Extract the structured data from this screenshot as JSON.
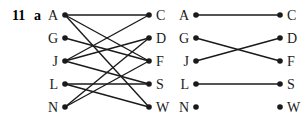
{
  "question": {
    "number": "11",
    "part": "a"
  },
  "graphs": [
    {
      "id": "graph-full",
      "left_nodes": [
        "A",
        "G",
        "J",
        "L",
        "N"
      ],
      "right_nodes": [
        "C",
        "D",
        "F",
        "S",
        "W"
      ],
      "edges": [
        [
          "A",
          "C"
        ],
        [
          "A",
          "F"
        ],
        [
          "A",
          "W"
        ],
        [
          "G",
          "F"
        ],
        [
          "J",
          "C"
        ],
        [
          "J",
          "D"
        ],
        [
          "J",
          "S"
        ],
        [
          "L",
          "S"
        ],
        [
          "L",
          "W"
        ],
        [
          "N",
          "D"
        ],
        [
          "N",
          "F"
        ]
      ]
    },
    {
      "id": "graph-matching",
      "left_nodes": [
        "A",
        "G",
        "J",
        "L",
        "N"
      ],
      "right_nodes": [
        "C",
        "D",
        "F",
        "S",
        "W"
      ],
      "edges": [
        [
          "A",
          "C"
        ],
        [
          "G",
          "F"
        ],
        [
          "J",
          "D"
        ],
        [
          "L",
          "S"
        ]
      ]
    }
  ],
  "colors": {
    "ink": "#1a1a1a",
    "background": "#ffffff"
  }
}
